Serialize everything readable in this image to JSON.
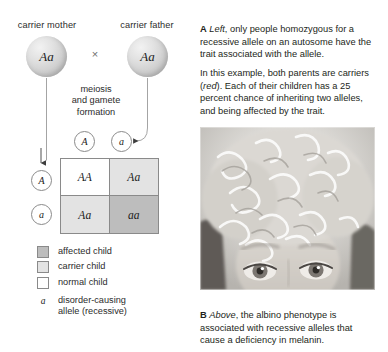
{
  "figure": {
    "cross_symbol": "×"
  },
  "diagram": {
    "mother_label": "carrier mother",
    "father_label": "carrier father",
    "mother_genotype": "Aa",
    "father_genotype": "Aa",
    "process_label": "meiosis\nand gamete\nformation",
    "process_line1": "meiosis",
    "process_line2": "and gamete",
    "process_line3": "formation",
    "gametes": {
      "father_top_left": "A",
      "father_top_right": "a",
      "mother_left_top": "A",
      "mother_left_bottom": "a"
    },
    "punnett": {
      "cells": [
        {
          "genotype": "AA",
          "category": "normal child",
          "fill": "#ffffff"
        },
        {
          "genotype": "Aa",
          "category": "carrier child",
          "fill": "#e3e3e3"
        },
        {
          "genotype": "Aa",
          "category": "carrier child",
          "fill": "#e3e3e3"
        },
        {
          "genotype": "aa",
          "category": "affected child",
          "fill": "#bdbdbd"
        }
      ]
    }
  },
  "legend": {
    "items": [
      {
        "label": "affected child",
        "swatch": "#bdbdbd"
      },
      {
        "label": "carrier child",
        "swatch": "#e3e3e3"
      },
      {
        "label": "normal child",
        "swatch": "#ffffff"
      }
    ],
    "allele_glyph": "a",
    "allele_line1": "disorder-causing",
    "allele_line2": "allele (recessive)"
  },
  "text": {
    "para_a_lead": "A",
    "para_a_ital": "Left",
    "para_a_body": ", only people homozygous for a recessive allele on an autosome have the trait associated with the allele.",
    "para_b_part1": "In this example, both parents are carriers (",
    "para_b_ital": "red",
    "para_b_part2": "). Each of their children has a 25 percent chance of inheriting two alleles, and being affected by the trait.",
    "caption_b_lead": "B",
    "caption_b_ital": "Above",
    "caption_b_body": ", the albino phenotype is associated with recessive alleles that cause a deficiency in melanin."
  },
  "photo": {
    "alt": "Grayscale photograph of a child with pale curly hair, showing the albino phenotype",
    "name": "albino-child-photo"
  },
  "colors": {
    "affected": "#bdbdbd",
    "carrier": "#e3e3e3",
    "normal": "#ffffff",
    "stroke": "#8a8a8a",
    "text": "#231f20"
  }
}
